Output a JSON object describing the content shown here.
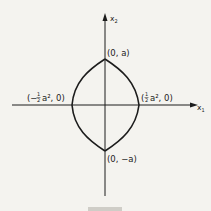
{
  "figure": {
    "axes": {
      "x_label": "x",
      "x_sub": "1",
      "y_label": "x",
      "y_sub": "2"
    },
    "points": {
      "top": "(0, a)",
      "bottom": "(0, −a)",
      "left_open": "(−",
      "left_num": "1",
      "left_den": "2",
      "left_rest": "a², 0)",
      "right_open": "(",
      "right_num": "1",
      "right_den": "2",
      "right_rest": "a², 0)"
    },
    "colors": {
      "ink": "#1c1c1c",
      "paper": "#f4f3ef"
    }
  }
}
